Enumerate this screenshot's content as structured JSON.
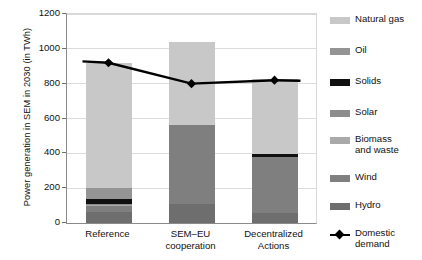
{
  "chart_data": {
    "type": "bar",
    "stacked": true,
    "title": "",
    "xlabel": "",
    "ylabel": "Power generation in SEM in 2030 (in TWh)",
    "ylim": [
      0,
      1200
    ],
    "yticks": [
      0,
      200,
      400,
      600,
      800,
      1000,
      1200
    ],
    "ytick_labels": [
      "0",
      "200",
      "400",
      "600",
      "800",
      "1000",
      "1200"
    ],
    "grid": true,
    "legend_position": "right",
    "categories": [
      "Reference",
      "SEM–EU\ncooperation",
      "Decentralized\nActions"
    ],
    "series": [
      {
        "name": "Hydro",
        "color": "#6e6e6e",
        "values": [
          65,
          110,
          60
        ]
      },
      {
        "name": "Wind",
        "color": "#7f7f7f",
        "values": [
          30,
          450,
          320
        ]
      },
      {
        "name": "Biomass and waste",
        "color": "#a9a9a9",
        "values": [
          10,
          0,
          0
        ]
      },
      {
        "name": "Solar",
        "color": "#8c8c8c",
        "values": [
          5,
          0,
          0
        ]
      },
      {
        "name": "Solids",
        "color": "#101010",
        "values": [
          30,
          0,
          18
        ]
      },
      {
        "name": "Oil",
        "color": "#949494",
        "values": [
          60,
          0,
          0
        ]
      },
      {
        "name": "Natural gas",
        "color": "#c8c8c8",
        "values": [
          720,
          480,
          427
        ]
      }
    ],
    "overlay_series": {
      "name": "Domestic demand",
      "type": "line",
      "marker": "diamond",
      "color": "#000000",
      "values": [
        920,
        800,
        820
      ]
    },
    "bar_totals": [
      920,
      1040,
      825
    ]
  },
  "legend": {
    "items": [
      {
        "label": "Natural gas",
        "swatch": "#c8c8c8",
        "kind": "patch"
      },
      {
        "label": "Oil",
        "swatch": "#949494",
        "kind": "patch"
      },
      {
        "label": "Solids",
        "swatch": "#101010",
        "kind": "patch"
      },
      {
        "label": "Solar",
        "swatch": "#8c8c8c",
        "kind": "patch"
      },
      {
        "label": "Biomass\nand waste",
        "swatch": "#a9a9a9",
        "kind": "patch"
      },
      {
        "label": "Wind",
        "swatch": "#7f7f7f",
        "kind": "patch"
      },
      {
        "label": "Hydro",
        "swatch": "#6e6e6e",
        "kind": "patch"
      },
      {
        "label": "Domestic\ndemand",
        "swatch": "#000000",
        "kind": "line-marker"
      }
    ]
  }
}
